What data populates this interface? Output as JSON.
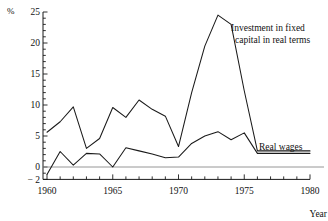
{
  "chart_data": {
    "type": "line",
    "title": "",
    "xlabel": "Year",
    "ylabel": "%",
    "xlim": [
      1960,
      1980
    ],
    "ylim": [
      -2,
      25
    ],
    "grid": false,
    "legend_position": "inline-annotation",
    "x_ticks_major": [
      1960,
      1965,
      1970,
      1975,
      1980
    ],
    "x_ticks_minor_step": 1,
    "y_ticks_major": [
      -2,
      0,
      5,
      10,
      15,
      20,
      25
    ],
    "y_ticks_minor_step": 1,
    "x": [
      1960,
      1961,
      1962,
      1963,
      1964,
      1965,
      1966,
      1967,
      1968,
      1969,
      1970,
      1971,
      1972,
      1973,
      1974,
      1975,
      1976,
      1977,
      1978,
      1979,
      1980
    ],
    "series": [
      {
        "name": "Investment in fixed capital in real terms",
        "label_line1": "Investment in fixed",
        "label_line2": "capital in real terms",
        "values": [
          5.6,
          7.3,
          9.7,
          3.0,
          4.6,
          9.6,
          8.0,
          10.8,
          9.3,
          8.2,
          3.3,
          12.0,
          19.5,
          24.5,
          23.0,
          12.3,
          2.6,
          2.6,
          2.6,
          2.6,
          2.6
        ]
      },
      {
        "name": "Real wages",
        "label_line1": "Real wages",
        "values": [
          -1.2,
          2.5,
          0.3,
          2.2,
          2.1,
          0.0,
          3.1,
          2.6,
          2.1,
          1.5,
          1.6,
          3.8,
          5.0,
          5.7,
          4.4,
          5.5,
          2.2,
          2.2,
          2.2,
          2.2,
          2.2
        ]
      }
    ]
  },
  "axis": {
    "y_unit_symbol": "%",
    "y_labels": [
      "25",
      "20",
      "15",
      "10",
      "5",
      "0",
      "− 2"
    ],
    "x_labels": [
      "1960",
      "1965",
      "1970",
      "1975",
      "1980"
    ],
    "x_axis_title": "Year"
  },
  "annotations": {
    "investment_line1": "Investment in fixed",
    "investment_line2": "capital in real terms",
    "real_wages": "Real wages"
  },
  "colors": {
    "line": "#1a1a1a",
    "axis": "#1a1a1a",
    "zero_rule": "#8a8a8a",
    "background": "#ffffff"
  }
}
